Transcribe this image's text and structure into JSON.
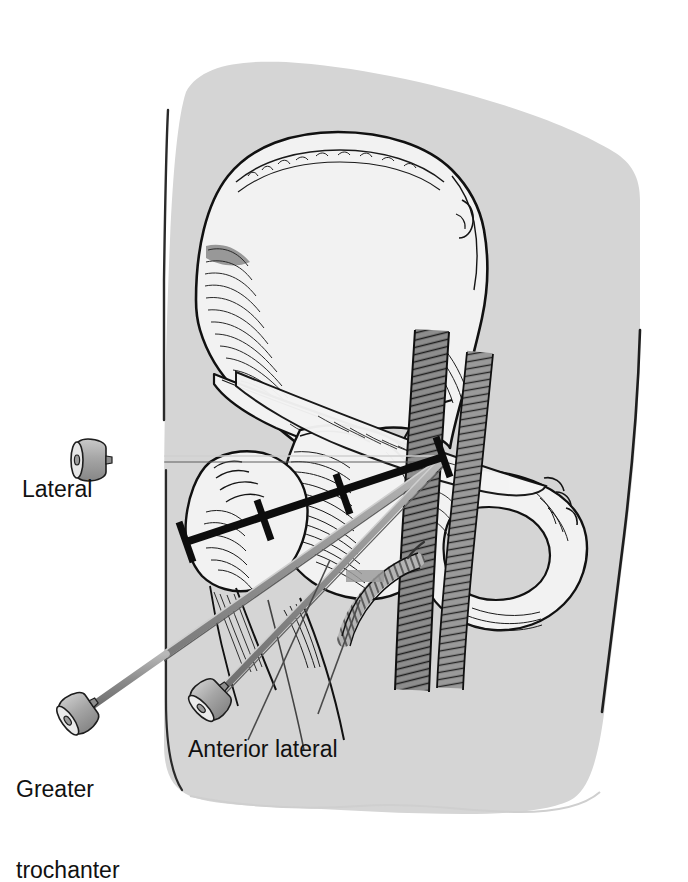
{
  "figure": {
    "kind": "medical-illustration",
    "background_color": "#ffffff",
    "body_color": "#d5d5d5",
    "bone_color": "#f2f2f2",
    "vessel_color": "#8f8f8f",
    "needle_color": "#9a9a9a",
    "line_color": "#101010"
  },
  "labels": {
    "lateral": "Lateral",
    "greater_trochanter_line1": "Greater",
    "greater_trochanter_line2": "trochanter",
    "anterior_lateral": "Anterior lateral"
  },
  "approaches": [
    {
      "name": "Lateral",
      "hub_x": 92,
      "hub_y": 460,
      "target_x": 440,
      "target_y": 460
    },
    {
      "name": "Greater trochanter",
      "hub_x": 78,
      "hub_y": 716,
      "target_x": 440,
      "target_y": 460
    },
    {
      "name": "Anterior lateral",
      "hub_x": 212,
      "hub_y": 700,
      "target_x": 440,
      "target_y": 460
    }
  ],
  "structures": [
    "iliac wing",
    "anterior superior iliac spine",
    "anterior inferior iliac spine",
    "acetabulum",
    "femoral head",
    "femoral neck",
    "greater trochanter",
    "superior pubic ramus",
    "inferior pubic ramus",
    "ischium",
    "obturator foramen",
    "femoral artery",
    "femoral vein",
    "inguinal ligament"
  ],
  "measurement_line": {
    "description": "bold reference line from greater trochanter to hip joint target",
    "start_x": 186,
    "start_y": 542,
    "end_x": 443,
    "end_y": 457,
    "tick_count": 3
  }
}
